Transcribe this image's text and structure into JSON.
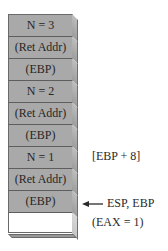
{
  "diagram": {
    "type": "stack-frame-diagram",
    "stack": {
      "cells": [
        {
          "label": "N = 3",
          "filled": true
        },
        {
          "label": "(Ret Addr)",
          "filled": true
        },
        {
          "label": "(EBP)",
          "filled": true
        },
        {
          "label": "N = 2",
          "filled": true
        },
        {
          "label": "(Ret Addr)",
          "filled": true
        },
        {
          "label": "(EBP)",
          "filled": true
        },
        {
          "label": "N = 1",
          "filled": true
        },
        {
          "label": "(Ret Addr)",
          "filled": true
        },
        {
          "label": "(EBP)",
          "filled": true
        },
        {
          "label": "",
          "filled": false
        }
      ],
      "fill_color": "#a9a9a9",
      "empty_color": "#ffffff",
      "border_color": "#6a6a6a"
    },
    "annotations": {
      "ebp_offset": "[EBP + 8]",
      "pointer_label": "ESP, EBP",
      "pointer_arrow": "left-arrow",
      "return_value": "(EAX = 1)"
    }
  }
}
